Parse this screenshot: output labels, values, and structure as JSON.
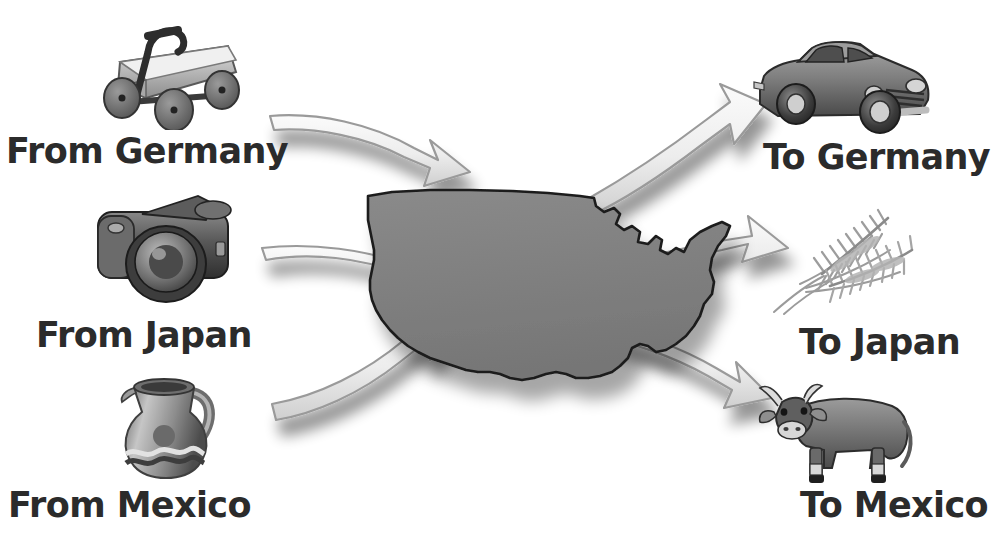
{
  "diagram": {
    "type": "trade-flow-map",
    "center_subject": "United States outline map",
    "colors": {
      "map_fill": "#808080",
      "map_outline": "#1c1c1c",
      "arrow_fill": "#e9e9e9",
      "arrow_edge": "#9a9a9a",
      "shadow": "#c9c9c9",
      "label_text": "#2b2b2b",
      "background": "#ffffff"
    }
  },
  "imports": {
    "heading_prefix": "From",
    "items": [
      {
        "label": "From Germany",
        "country": "Germany",
        "icon": "toy-wagon-icon",
        "goods": "toy wagon",
        "direction": "inbound"
      },
      {
        "label": "From Japan",
        "country": "Japan",
        "icon": "camera-icon",
        "goods": "camera",
        "direction": "inbound"
      },
      {
        "label": "From Mexico",
        "country": "Mexico",
        "icon": "pottery-pitcher-icon",
        "goods": "pottery pitcher",
        "direction": "inbound"
      }
    ]
  },
  "exports": {
    "heading_prefix": "To",
    "items": [
      {
        "label": "To Germany",
        "country": "Germany",
        "icon": "car-icon",
        "goods": "automobile",
        "direction": "outbound"
      },
      {
        "label": "To Japan",
        "country": "Japan",
        "icon": "wheat-icon",
        "goods": "wheat",
        "direction": "outbound"
      },
      {
        "label": "To Mexico",
        "country": "Mexico",
        "icon": "cow-icon",
        "goods": "cattle",
        "direction": "outbound"
      }
    ]
  },
  "arrows": {
    "inbound_count": 3,
    "outbound_count": 3,
    "inbound_direction": "points toward the United States",
    "outbound_direction": "points away from the United States"
  }
}
